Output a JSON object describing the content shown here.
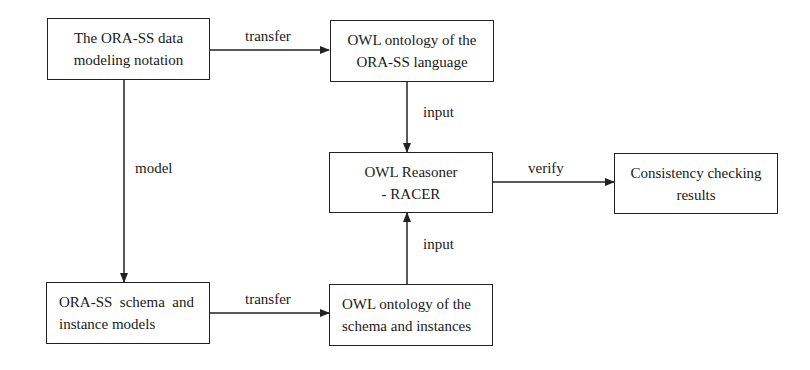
{
  "diagram": {
    "nodes": [
      {
        "id": "notation",
        "lines": [
          "The ORA-SS data",
          "modeling notation"
        ]
      },
      {
        "id": "owl_language",
        "lines": [
          "OWL ontology of the",
          "ORA-SS language"
        ]
      },
      {
        "id": "reasoner",
        "lines": [
          "OWL Reasoner",
          "- RACER"
        ]
      },
      {
        "id": "results",
        "lines": [
          "Consistency checking",
          "results"
        ]
      },
      {
        "id": "schema_models",
        "lines": [
          "ORA-SS  schema  and",
          "instance models"
        ]
      },
      {
        "id": "owl_schema",
        "lines": [
          "OWL ontology of the",
          "schema and instances"
        ]
      }
    ],
    "edges": [
      {
        "from": "notation",
        "to": "owl_language",
        "label": "transfer"
      },
      {
        "from": "owl_language",
        "to": "reasoner",
        "label": "input"
      },
      {
        "from": "notation",
        "to": "schema_models",
        "label": "model"
      },
      {
        "from": "reasoner",
        "to": "results",
        "label": "verify"
      },
      {
        "from": "schema_models",
        "to": "owl_schema",
        "label": "transfer"
      },
      {
        "from": "owl_schema",
        "to": "reasoner",
        "label": "input"
      }
    ]
  }
}
